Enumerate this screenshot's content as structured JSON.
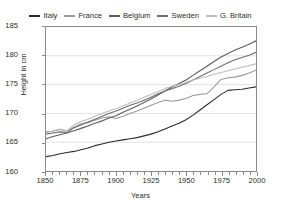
{
  "chart_data": {
    "type": "line",
    "title": "",
    "xlabel": "Years",
    "ylabel": "Height in cm",
    "xlim": [
      1850,
      2000
    ],
    "ylim": [
      160,
      185
    ],
    "yticks": [
      160,
      165,
      170,
      175,
      180,
      185
    ],
    "xticks": [
      1850,
      1875,
      1900,
      1925,
      1950,
      1975,
      2000
    ],
    "xminor_step": 5,
    "grid": "horizontal",
    "legend_position": "top-center",
    "x": [
      1850,
      1855,
      1860,
      1865,
      1870,
      1875,
      1880,
      1885,
      1890,
      1895,
      1900,
      1905,
      1910,
      1915,
      1920,
      1925,
      1930,
      1935,
      1940,
      1945,
      1950,
      1955,
      1960,
      1965,
      1970,
      1975,
      1980,
      1985,
      1990,
      1995,
      2000
    ],
    "series": [
      {
        "name": "Italy",
        "color": "#2b2b2b",
        "values": [
          162.5,
          162.7,
          163.0,
          163.2,
          163.4,
          163.7,
          164.0,
          164.4,
          164.7,
          165.0,
          165.2,
          165.4,
          165.6,
          165.8,
          166.1,
          166.4,
          166.8,
          167.3,
          167.8,
          168.3,
          168.9,
          169.7,
          170.6,
          171.5,
          172.4,
          173.3,
          174.0,
          174.1,
          174.2,
          174.4,
          174.6
        ]
      },
      {
        "name": "France",
        "color": "#9a9a9a",
        "values": [
          166.8,
          166.9,
          167.2,
          167.0,
          167.6,
          168.2,
          168.4,
          168.8,
          169.2,
          169.4,
          169.1,
          169.5,
          170.0,
          170.4,
          170.9,
          171.4,
          171.9,
          172.3,
          172.1,
          172.3,
          172.6,
          173.1,
          173.3,
          173.4,
          174.6,
          175.9,
          176.2,
          176.3,
          176.6,
          177.0,
          177.5
        ]
      },
      {
        "name": "Belgium",
        "color": "#5d5d5d",
        "values": [
          165.6,
          166.0,
          166.3,
          166.6,
          167.0,
          167.4,
          167.8,
          168.3,
          168.7,
          169.2,
          169.6,
          170.2,
          170.7,
          171.3,
          171.9,
          172.5,
          173.2,
          173.9,
          174.6,
          175.2,
          175.8,
          176.6,
          177.4,
          178.2,
          179.0,
          179.8,
          180.4,
          181.0,
          181.5,
          182.0,
          182.6
        ]
      },
      {
        "name": "Sweden",
        "color": "#6f6f6f",
        "values": [
          166.4,
          166.6,
          166.8,
          166.7,
          167.5,
          168.0,
          168.5,
          169.0,
          169.5,
          170.0,
          170.4,
          170.9,
          171.4,
          171.8,
          172.3,
          172.8,
          173.4,
          173.9,
          174.3,
          174.7,
          175.2,
          175.8,
          176.4,
          177.0,
          177.6,
          178.2,
          178.8,
          179.3,
          179.7,
          180.1,
          180.6
        ]
      },
      {
        "name": "G. Britain",
        "color": "#bdbdbd",
        "values": [
          166.6,
          167.0,
          167.3,
          167.0,
          168.0,
          168.6,
          169.0,
          169.5,
          170.0,
          170.4,
          170.8,
          171.3,
          171.8,
          172.3,
          172.8,
          173.3,
          173.8,
          174.3,
          174.7,
          175.0,
          175.4,
          175.8,
          176.1,
          176.4,
          176.8,
          177.1,
          177.4,
          177.7,
          178.0,
          178.3,
          178.6
        ]
      }
    ]
  }
}
